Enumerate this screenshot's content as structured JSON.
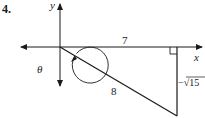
{
  "problem": {
    "number": "4."
  },
  "diagram": {
    "axes": {
      "x_label": "x",
      "y_label": "y"
    },
    "angle_label": "θ",
    "triangle": {
      "adjacent_label": "7",
      "hypotenuse_label": "8",
      "opposite_label": "−√15"
    },
    "colors": {
      "stroke": "#1a1a1a",
      "background": "#ffffff"
    }
  }
}
